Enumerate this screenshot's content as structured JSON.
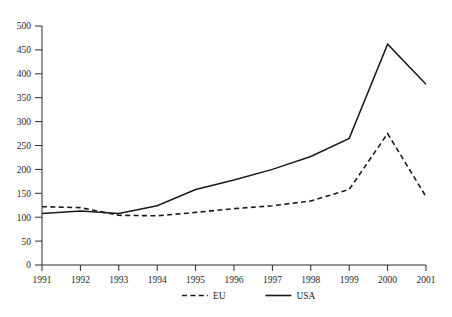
{
  "chart_data": {
    "type": "line",
    "title": "",
    "subtitle": "",
    "xlabel": "",
    "ylabel": "",
    "categories": [
      "1991",
      "1992",
      "1993",
      "1994",
      "1995",
      "1996",
      "1997",
      "1998",
      "1999",
      "2000",
      "2001"
    ],
    "x": [
      1991,
      1992,
      1993,
      1994,
      1995,
      1996,
      1997,
      1998,
      1999,
      2000,
      2001
    ],
    "series": [
      {
        "name": "EU",
        "style": "dashed",
        "color": "#1a1a1a",
        "values": [
          122,
          120,
          104,
          103,
          110,
          118,
          124,
          134,
          158,
          275,
          143
        ]
      },
      {
        "name": "USA",
        "style": "solid",
        "color": "#1a1a1a",
        "values": [
          108,
          113,
          108,
          124,
          158,
          178,
          200,
          227,
          265,
          462,
          378
        ]
      }
    ],
    "ylim": [
      0,
      500
    ],
    "xlim": [
      1991,
      2001
    ],
    "yticks": [
      0,
      50,
      100,
      150,
      200,
      250,
      300,
      350,
      400,
      450,
      500
    ],
    "ytick_labels": [
      "0",
      "50",
      "100",
      "150",
      "200",
      "250",
      "300",
      "350",
      "400",
      "450",
      "500"
    ],
    "xticks": [
      1991,
      1992,
      1993,
      1994,
      1995,
      1996,
      1997,
      1998,
      1999,
      2000,
      2001
    ],
    "xtick_labels": [
      "1991",
      "1992",
      "1993",
      "1994",
      "1995",
      "1996",
      "1997",
      "1998",
      "1999",
      "2000",
      "2001"
    ],
    "grid": false,
    "legend_position": "bottom",
    "legend": [
      "EU",
      "USA"
    ]
  }
}
